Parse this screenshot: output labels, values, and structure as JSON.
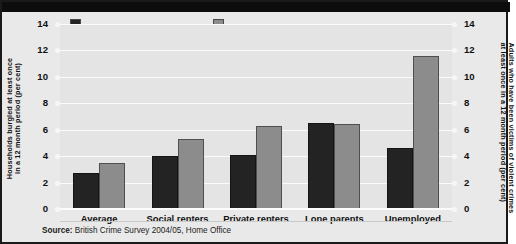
{
  "figure": {
    "background": "#e9e9e9",
    "plot_background": "#e4e4e4",
    "border_color": "#1a1a1a"
  },
  "legend": {
    "items": [
      {
        "label": "Burglaries (LH axis)",
        "color": "#232323",
        "axis": "left"
      },
      {
        "label": "Victims of violence (RH axis)",
        "color": "#8c8c8c",
        "axis": "right"
      }
    ]
  },
  "axes": {
    "left_title_line1": "Households burgled at least once",
    "left_title_line2": "in a 12 month period (per cent)",
    "right_title_line1": "Adults who have been victims of violent crimes",
    "right_title_line2": "at least once in a 12 month period (per cent)",
    "ticks": [
      "14",
      "12",
      "10",
      "8",
      "6",
      "4",
      "2",
      "0"
    ]
  },
  "source": {
    "label": "Source:",
    "text": "British Crime Survey 2004/05, Home Office"
  },
  "chart_data": {
    "type": "bar",
    "title": "",
    "xlabel": "",
    "ylabel": "Households burgled at least once in a 12 month period (per cent)",
    "ylabel_right": "Adults who have been victims of violent crimes at least once in a 12 month period (per cent)",
    "categories": [
      "Average",
      "Social renters",
      "Private renters",
      "Lone parents",
      "Unemployed"
    ],
    "series": [
      {
        "name": "Burglaries (LH axis)",
        "color": "#232323",
        "axis": "left",
        "values": [
          2.7,
          4.0,
          4.1,
          6.5,
          4.6
        ]
      },
      {
        "name": "Victims of violence (RH axis)",
        "color": "#8c8c8c",
        "axis": "right",
        "values": [
          3.5,
          5.3,
          6.3,
          6.4,
          11.6
        ]
      }
    ],
    "ylim": [
      0,
      14
    ],
    "ylim_right": [
      0,
      14
    ],
    "yticks": [
      0,
      2,
      4,
      6,
      8,
      10,
      12,
      14
    ],
    "grid": true,
    "legend_position": "top"
  }
}
